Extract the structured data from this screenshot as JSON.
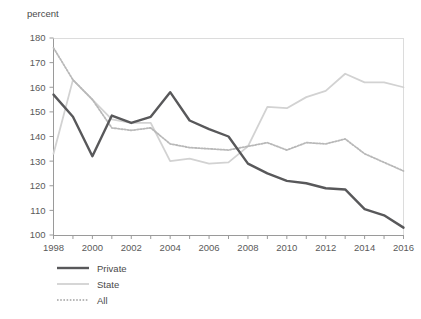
{
  "chart_data": {
    "type": "line",
    "title": "",
    "subtitle": "",
    "xlabel": "",
    "ylabel": "percent",
    "ylim": [
      100,
      180
    ],
    "xlim": [
      1998,
      2016
    ],
    "ytick_step": 10,
    "xtick_step": 1,
    "xlabel_step": 2,
    "grid": false,
    "legend_position": "bottom-left",
    "yticks": [
      "180",
      "170",
      "160",
      "150",
      "140",
      "130",
      "120",
      "110",
      "100"
    ],
    "xticks": [
      "1998",
      "2000",
      "2002",
      "2004",
      "2006",
      "2008",
      "2010",
      "2012",
      "2014",
      "2016"
    ],
    "x": [
      1998,
      1999,
      2000,
      2001,
      2002,
      2003,
      2004,
      2005,
      2006,
      2007,
      2008,
      2009,
      2010,
      2011,
      2012,
      2013,
      2014,
      2015,
      2016
    ],
    "series": [
      {
        "name": "Private",
        "style": "solid-thick",
        "color": "#58585a",
        "values": [
          157,
          148,
          132,
          148.5,
          145.5,
          148,
          158,
          146.5,
          143,
          140,
          129,
          125,
          122,
          121,
          119,
          118.5,
          110.5,
          108,
          103
        ]
      },
      {
        "name": "State",
        "style": "solid-thin",
        "color": "#d2d2d2",
        "values": [
          133,
          163,
          155,
          147,
          145.5,
          145.5,
          130,
          131,
          129,
          129.5,
          136,
          152,
          151.5,
          156,
          158.5,
          165.5,
          162,
          162,
          160
        ]
      },
      {
        "name": "All",
        "style": "dotted",
        "color": "#b8b8b8",
        "values": [
          176,
          163,
          155,
          143.5,
          142.5,
          143.5,
          137,
          135.5,
          135,
          134.5,
          136,
          137.5,
          134.5,
          137.5,
          137,
          139,
          133,
          129.5,
          126
        ]
      }
    ]
  },
  "legend": {
    "items": [
      {
        "label": "Private"
      },
      {
        "label": "State"
      },
      {
        "label": "All"
      }
    ]
  }
}
